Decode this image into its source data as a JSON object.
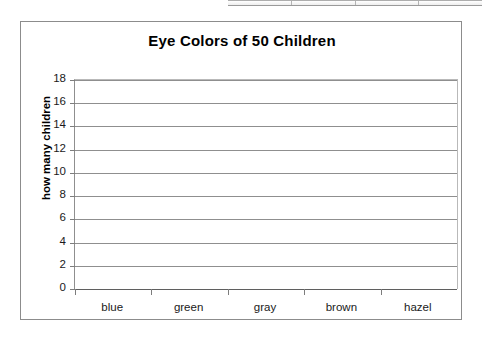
{
  "table_sliver": {
    "name": "partial-table-top",
    "cell_count": 4
  },
  "chart_data": {
    "type": "bar",
    "title": "Eye Colors of 50 Children",
    "xlabel": "",
    "ylabel": "how many children",
    "categories": [
      "blue",
      "green",
      "gray",
      "brown",
      "hazel"
    ],
    "values": [
      null,
      null,
      null,
      null,
      null
    ],
    "ylim": [
      0,
      18
    ],
    "ytick_step": 2,
    "yticks": [
      "18",
      "16",
      "14",
      "12",
      "10",
      "8",
      "6",
      "4",
      "2",
      "0"
    ],
    "grid": "horizontal",
    "legend": "none",
    "note": "empty grid - no bars plotted",
    "colors": {
      "frame": "#8c8c8c",
      "gridline": "#8f8f8f",
      "axis": "#5f8f8f",
      "text": "#000000",
      "plot_background": "#ffffff"
    }
  }
}
